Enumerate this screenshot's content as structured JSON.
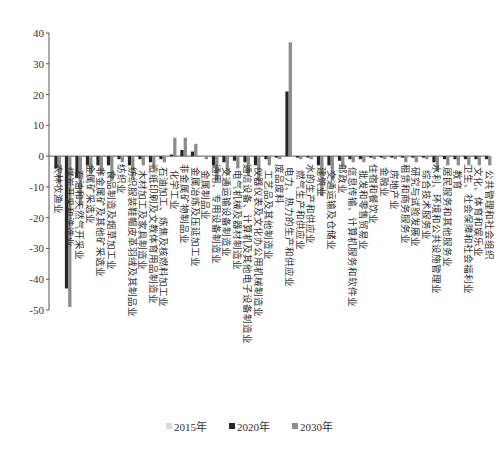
{
  "chart_data": {
    "type": "bar",
    "title": "",
    "xlabel": "",
    "ylabel": "",
    "ylim": [
      -50,
      40
    ],
    "yticks": [
      40,
      30,
      20,
      10,
      0,
      -10,
      -20,
      -30,
      -40,
      -50
    ],
    "grid": false,
    "legend_position": "bottom",
    "categories": [
      "农林牧渔业",
      "煤炭开采和洗选业",
      "石油和天然气开采业",
      "金属矿采选业",
      "非金属矿及其他矿采选业",
      "食品制造及烟草加工业",
      "纺织业",
      "纺织服装鞋帽皮革羽绒及其制品业",
      "木材加工及家具制造业",
      "造纸印刷及文教体育用品制造业",
      "石油加工、炼焦及核燃料加工业",
      "化学工业",
      "非金属矿物制品业",
      "金属冶炼及压延加工业",
      "金属制品业",
      "通用、专用设备制造业",
      "交通运输设备制造业",
      "电气机械及器材制造业",
      "通信设备、计算机及其他电子设备制造业",
      "仪器仪表及文化办公用机械制造业",
      "工艺品及其他制造业",
      "废品废料",
      "电力、热力的生产和供应业",
      "燃气生产和供应业",
      "水的生产和供应业",
      "建筑业",
      "交通运输及仓储业",
      "邮政业",
      "信息传输、计算机服务和软件业",
      "批发和零售贸易业",
      "住宿和餐饮业",
      "金融业",
      "房地产业",
      "租赁和商务服务业",
      "研究与试验发展业",
      "综合技术服务业",
      "水利、环境和公共设施管理业",
      "居民服务和其他服务业",
      "教育",
      "卫生、社会保障和社会福利业",
      "文化、体育和娱乐业",
      "公共管理和社会组织"
    ],
    "series": [
      {
        "name": "2015年",
        "color": "#d9d9d9",
        "values": [
          0,
          0,
          0,
          0,
          0,
          0,
          0,
          0,
          0,
          0,
          0,
          0,
          0,
          0,
          0,
          0,
          0,
          0,
          0,
          0,
          0,
          0,
          0,
          0,
          0,
          0,
          0,
          0,
          0,
          0,
          0,
          0,
          0,
          0,
          0,
          0,
          0,
          0,
          0,
          0,
          0,
          0
        ]
      },
      {
        "name": "2020年",
        "color": "#262626",
        "values": [
          -4,
          -43,
          -7,
          -3,
          -3,
          -3,
          -1,
          -3,
          -1,
          -2,
          -1,
          0.5,
          2,
          1.5,
          0,
          -3,
          -2,
          -1.5,
          -2,
          -3,
          -1,
          -0.5,
          21,
          -0.5,
          -0.5,
          -3,
          -3,
          -1.5,
          -1,
          -1,
          -0.5,
          -0.5,
          -0.5,
          -0.5,
          -0.5,
          -0.5,
          -2,
          -1,
          -1,
          -1,
          -1,
          -1
        ]
      },
      {
        "name": "2030年",
        "color": "#8c8c8c",
        "values": [
          -9,
          -49,
          -16,
          -6,
          -6,
          -8,
          -2,
          -7,
          -3,
          -4,
          -2,
          6,
          6,
          4,
          -1,
          -8,
          -6,
          -4,
          -6,
          -8,
          -3,
          -1,
          37,
          -1,
          -1,
          -13,
          -8,
          -3,
          -2,
          -2,
          -1,
          -1,
          -1,
          -2,
          -2,
          -1,
          -5,
          -3,
          -3,
          -3,
          -3,
          -3
        ]
      }
    ]
  },
  "legend": {
    "items": [
      {
        "label": "2015年",
        "color": "#d9d9d9"
      },
      {
        "label": "2020年",
        "color": "#262626"
      },
      {
        "label": "2030年",
        "color": "#8c8c8c"
      }
    ]
  }
}
